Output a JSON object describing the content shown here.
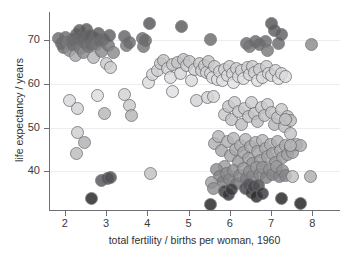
{
  "chart_data": {
    "type": "scatter",
    "title": "",
    "xlabel": "total fertility / births per woman, 1960",
    "ylabel": "life expectancy / years",
    "xlim": [
      1.62,
      8.67
    ],
    "ylim": [
      31.2,
      76.3
    ],
    "xticks": [
      2,
      3,
      4,
      5,
      6,
      7,
      8
    ],
    "yticks": [
      40,
      50,
      60,
      70
    ],
    "xtick_labels": [
      "2",
      "3",
      "4",
      "5",
      "6",
      "7",
      "8"
    ],
    "ytick_labels": [
      "40",
      "50",
      "60",
      "70"
    ],
    "grid": "horizontal",
    "legend": "none",
    "marker": {
      "shape": "circle",
      "size_px": 13,
      "opacity": 0.82,
      "edge_color": "#6f6f72"
    },
    "shade_levels": {
      "dark": "#6b6b6e",
      "near_black": "#202022",
      "mid": "#9a9a9d",
      "light": "#c9c9cc",
      "very_light": "#e4e4e7"
    },
    "points": [
      {
        "x": 1.85,
        "y": 70.2,
        "c": "#6b6b6e"
      },
      {
        "x": 1.92,
        "y": 69.1,
        "c": "#6b6b6e"
      },
      {
        "x": 1.98,
        "y": 68.2,
        "c": "#6b6b6e"
      },
      {
        "x": 2.02,
        "y": 70.4,
        "c": "#6b6b6e"
      },
      {
        "x": 2.06,
        "y": 69.4,
        "c": "#7a7a7d"
      },
      {
        "x": 2.12,
        "y": 67.6,
        "c": "#8a8a8d"
      },
      {
        "x": 2.18,
        "y": 70.1,
        "c": "#6b6b6e"
      },
      {
        "x": 2.22,
        "y": 68.6,
        "c": "#6b6b6e"
      },
      {
        "x": 2.25,
        "y": 66.3,
        "c": "#a8a8ab"
      },
      {
        "x": 2.28,
        "y": 71.2,
        "c": "#606063"
      },
      {
        "x": 2.32,
        "y": 69.8,
        "c": "#6b6b6e"
      },
      {
        "x": 2.35,
        "y": 72.0,
        "c": "#5c5c5f"
      },
      {
        "x": 2.38,
        "y": 68.0,
        "c": "#7a7a7d"
      },
      {
        "x": 2.42,
        "y": 70.6,
        "c": "#646467"
      },
      {
        "x": 2.45,
        "y": 67.2,
        "c": "#8a8a8d"
      },
      {
        "x": 2.48,
        "y": 69.3,
        "c": "#6b6b6e"
      },
      {
        "x": 2.52,
        "y": 72.4,
        "c": "#5a5a5d"
      },
      {
        "x": 2.55,
        "y": 70.8,
        "c": "#646467"
      },
      {
        "x": 2.58,
        "y": 68.4,
        "c": "#767679"
      },
      {
        "x": 2.62,
        "y": 71.0,
        "c": "#606063"
      },
      {
        "x": 2.66,
        "y": 69.0,
        "c": "#6b6b6e"
      },
      {
        "x": 2.7,
        "y": 66.0,
        "c": "#b8b8bb"
      },
      {
        "x": 2.74,
        "y": 70.3,
        "c": "#6b6b6e"
      },
      {
        "x": 2.78,
        "y": 68.8,
        "c": "#767679"
      },
      {
        "x": 2.82,
        "y": 71.4,
        "c": "#5c5c5f"
      },
      {
        "x": 2.86,
        "y": 69.6,
        "c": "#6b6b6e"
      },
      {
        "x": 2.9,
        "y": 67.4,
        "c": "#8a8a8d"
      },
      {
        "x": 2.95,
        "y": 70.0,
        "c": "#6b6b6e"
      },
      {
        "x": 3.0,
        "y": 64.5,
        "c": "#c9c9cc"
      },
      {
        "x": 3.05,
        "y": 68.7,
        "c": "#767679"
      },
      {
        "x": 3.08,
        "y": 70.9,
        "c": "#606063"
      },
      {
        "x": 3.12,
        "y": 63.6,
        "c": "#cfcfd2"
      },
      {
        "x": 3.18,
        "y": 67.0,
        "c": "#8a8a8d"
      },
      {
        "x": 3.45,
        "y": 70.8,
        "c": "#646467"
      },
      {
        "x": 3.5,
        "y": 68.6,
        "c": "#7a7a7d"
      },
      {
        "x": 3.56,
        "y": 69.4,
        "c": "#6b6b6e"
      },
      {
        "x": 3.88,
        "y": 70.3,
        "c": "#6b6b6e"
      },
      {
        "x": 3.92,
        "y": 68.5,
        "c": "#767679"
      },
      {
        "x": 3.96,
        "y": 69.8,
        "c": "#6b6b6e"
      },
      {
        "x": 4.06,
        "y": 73.8,
        "c": "#55555a"
      },
      {
        "x": 4.82,
        "y": 73.0,
        "c": "#5a5a5d"
      },
      {
        "x": 5.52,
        "y": 70.1,
        "c": "#6b6b6e"
      },
      {
        "x": 6.4,
        "y": 69.2,
        "c": "#6b6b6e"
      },
      {
        "x": 6.48,
        "y": 68.4,
        "c": "#767679"
      },
      {
        "x": 6.62,
        "y": 69.7,
        "c": "#6b6b6e"
      },
      {
        "x": 6.72,
        "y": 68.9,
        "c": "#6b6b6e"
      },
      {
        "x": 6.86,
        "y": 69.5,
        "c": "#6b6b6e"
      },
      {
        "x": 6.92,
        "y": 67.6,
        "c": "#7a7a7d"
      },
      {
        "x": 7.02,
        "y": 73.6,
        "c": "#55555a"
      },
      {
        "x": 7.08,
        "y": 72.0,
        "c": "#5c5c5f"
      },
      {
        "x": 7.18,
        "y": 69.2,
        "c": "#6b6b6e"
      },
      {
        "x": 7.24,
        "y": 71.2,
        "c": "#606063"
      },
      {
        "x": 7.98,
        "y": 68.8,
        "c": "#8a8a8d"
      },
      {
        "x": 2.12,
        "y": 56.2,
        "c": "#d8d8db"
      },
      {
        "x": 2.3,
        "y": 54.3,
        "c": "#d2d2d5"
      },
      {
        "x": 2.32,
        "y": 48.9,
        "c": "#cfcfd2"
      },
      {
        "x": 2.28,
        "y": 44.0,
        "c": "#bcbcbf"
      },
      {
        "x": 2.48,
        "y": 46.6,
        "c": "#b0b0b3"
      },
      {
        "x": 2.64,
        "y": 33.8,
        "c": "#242426"
      },
      {
        "x": 2.8,
        "y": 57.4,
        "c": "#dcdcdf"
      },
      {
        "x": 2.96,
        "y": 53.2,
        "c": "#b8b8bb"
      },
      {
        "x": 2.9,
        "y": 38.0,
        "c": "#56565a"
      },
      {
        "x": 3.04,
        "y": 38.5,
        "c": "#56565a"
      },
      {
        "x": 3.12,
        "y": 38.7,
        "c": "#4e4e52"
      },
      {
        "x": 3.44,
        "y": 57.6,
        "c": "#d2d2d5"
      },
      {
        "x": 3.58,
        "y": 55.0,
        "c": "#c9c9cc"
      },
      {
        "x": 3.62,
        "y": 52.8,
        "c": "#b6b6b9"
      },
      {
        "x": 4.08,
        "y": 39.5,
        "c": "#c2c2c5"
      },
      {
        "x": 4.02,
        "y": 60.2,
        "c": "#dcdcdf"
      },
      {
        "x": 4.12,
        "y": 62.0,
        "c": "#d6d6d9"
      },
      {
        "x": 4.24,
        "y": 63.0,
        "c": "#cfcfd2"
      },
      {
        "x": 4.32,
        "y": 64.6,
        "c": "#c9c9cc"
      },
      {
        "x": 4.4,
        "y": 65.3,
        "c": "#c4c4c7"
      },
      {
        "x": 4.48,
        "y": 63.4,
        "c": "#cfcfd2"
      },
      {
        "x": 4.56,
        "y": 61.5,
        "c": "#dcdcdf"
      },
      {
        "x": 4.6,
        "y": 64.4,
        "c": "#c9c9cc"
      },
      {
        "x": 4.62,
        "y": 58.2,
        "c": "#e0e0e3"
      },
      {
        "x": 4.72,
        "y": 64.9,
        "c": "#c4c4c7"
      },
      {
        "x": 4.8,
        "y": 62.4,
        "c": "#d6d6d9"
      },
      {
        "x": 4.88,
        "y": 65.6,
        "c": "#c2c2c5"
      },
      {
        "x": 4.96,
        "y": 64.2,
        "c": "#cccccf"
      },
      {
        "x": 5.02,
        "y": 65.0,
        "c": "#c4c4c7"
      },
      {
        "x": 5.08,
        "y": 60.8,
        "c": "#dadade"
      },
      {
        "x": 5.14,
        "y": 63.2,
        "c": "#cfcfd2"
      },
      {
        "x": 5.2,
        "y": 56.2,
        "c": "#d2d2d5"
      },
      {
        "x": 5.26,
        "y": 64.6,
        "c": "#c9c9cc"
      },
      {
        "x": 5.32,
        "y": 63.0,
        "c": "#cfcfd2"
      },
      {
        "x": 5.38,
        "y": 64.2,
        "c": "#c9c9cc"
      },
      {
        "x": 5.44,
        "y": 62.6,
        "c": "#d4d4d7"
      },
      {
        "x": 5.48,
        "y": 65.0,
        "c": "#c4c4c7"
      },
      {
        "x": 5.52,
        "y": 62.2,
        "c": "#d8d8db"
      },
      {
        "x": 5.46,
        "y": 56.8,
        "c": "#d2d2d5"
      },
      {
        "x": 5.58,
        "y": 61.4,
        "c": "#dcdcdf"
      },
      {
        "x": 5.64,
        "y": 63.8,
        "c": "#cccccf"
      },
      {
        "x": 5.7,
        "y": 61.0,
        "c": "#e0e0e3"
      },
      {
        "x": 5.76,
        "y": 62.8,
        "c": "#d4d4d7"
      },
      {
        "x": 5.82,
        "y": 60.6,
        "c": "#e0e0e3"
      },
      {
        "x": 5.88,
        "y": 63.2,
        "c": "#cfcfd2"
      },
      {
        "x": 5.94,
        "y": 61.8,
        "c": "#dadade"
      },
      {
        "x": 6.0,
        "y": 64.0,
        "c": "#cccccf"
      },
      {
        "x": 6.06,
        "y": 62.4,
        "c": "#d6d6d9"
      },
      {
        "x": 6.1,
        "y": 60.2,
        "c": "#e2e2e5"
      },
      {
        "x": 6.16,
        "y": 63.4,
        "c": "#cfcfd2"
      },
      {
        "x": 6.22,
        "y": 61.6,
        "c": "#dcdcdf"
      },
      {
        "x": 6.28,
        "y": 63.0,
        "c": "#d2d2d5"
      },
      {
        "x": 6.34,
        "y": 61.2,
        "c": "#e0e0e3"
      },
      {
        "x": 6.42,
        "y": 63.6,
        "c": "#cccccf"
      },
      {
        "x": 6.48,
        "y": 62.0,
        "c": "#d8d8db"
      },
      {
        "x": 6.54,
        "y": 64.0,
        "c": "#cccccf"
      },
      {
        "x": 6.6,
        "y": 62.6,
        "c": "#d4d4d7"
      },
      {
        "x": 6.66,
        "y": 60.8,
        "c": "#e0e0e3"
      },
      {
        "x": 6.72,
        "y": 63.2,
        "c": "#cfcfd2"
      },
      {
        "x": 6.8,
        "y": 61.4,
        "c": "#dcdcdf"
      },
      {
        "x": 6.88,
        "y": 63.8,
        "c": "#cccccf"
      },
      {
        "x": 6.94,
        "y": 62.2,
        "c": "#d8d8db"
      },
      {
        "x": 7.02,
        "y": 61.8,
        "c": "#dadade"
      },
      {
        "x": 7.1,
        "y": 63.0,
        "c": "#d2d2d5"
      },
      {
        "x": 7.18,
        "y": 61.2,
        "c": "#e0e0e3"
      },
      {
        "x": 7.26,
        "y": 62.4,
        "c": "#d6d6d9"
      },
      {
        "x": 7.34,
        "y": 61.6,
        "c": "#dcdcdf"
      },
      {
        "x": 5.6,
        "y": 57.0,
        "c": "#d6d6d9"
      },
      {
        "x": 5.88,
        "y": 53.0,
        "c": "#c9c9cc"
      },
      {
        "x": 5.96,
        "y": 54.8,
        "c": "#c4c4c7"
      },
      {
        "x": 6.04,
        "y": 51.8,
        "c": "#c2c2c5"
      },
      {
        "x": 6.12,
        "y": 55.6,
        "c": "#cccccf"
      },
      {
        "x": 6.2,
        "y": 53.6,
        "c": "#c4c4c7"
      },
      {
        "x": 6.28,
        "y": 50.8,
        "c": "#bcbcbf"
      },
      {
        "x": 6.36,
        "y": 54.4,
        "c": "#c9c9cc"
      },
      {
        "x": 6.44,
        "y": 52.4,
        "c": "#c2c2c5"
      },
      {
        "x": 6.52,
        "y": 55.8,
        "c": "#cccccf"
      },
      {
        "x": 6.6,
        "y": 53.2,
        "c": "#c4c4c7"
      },
      {
        "x": 6.68,
        "y": 51.4,
        "c": "#bcbcbf"
      },
      {
        "x": 6.76,
        "y": 54.6,
        "c": "#c9c9cc"
      },
      {
        "x": 6.84,
        "y": 52.8,
        "c": "#c2c2c5"
      },
      {
        "x": 6.92,
        "y": 55.2,
        "c": "#cccccf"
      },
      {
        "x": 7.0,
        "y": 53.4,
        "c": "#c4c4c7"
      },
      {
        "x": 7.08,
        "y": 50.6,
        "c": "#b8b8bb"
      },
      {
        "x": 7.16,
        "y": 52.2,
        "c": "#c2c2c5"
      },
      {
        "x": 7.24,
        "y": 54.0,
        "c": "#c9c9cc"
      },
      {
        "x": 7.32,
        "y": 50.2,
        "c": "#bcbcbf"
      },
      {
        "x": 7.4,
        "y": 52.6,
        "c": "#c2c2c5"
      },
      {
        "x": 7.48,
        "y": 51.6,
        "c": "#bcbcbf"
      },
      {
        "x": 7.46,
        "y": 48.6,
        "c": "#c4c4c7"
      },
      {
        "x": 5.64,
        "y": 46.4,
        "c": "#b0b0b3"
      },
      {
        "x": 5.72,
        "y": 48.0,
        "c": "#b6b6b9"
      },
      {
        "x": 5.8,
        "y": 44.8,
        "c": "#a8a8ab"
      },
      {
        "x": 5.86,
        "y": 41.2,
        "c": "#9a9a9d"
      },
      {
        "x": 5.94,
        "y": 46.8,
        "c": "#b0b0b3"
      },
      {
        "x": 6.02,
        "y": 43.6,
        "c": "#a4a4a7"
      },
      {
        "x": 6.08,
        "y": 47.6,
        "c": "#b6b6b9"
      },
      {
        "x": 6.14,
        "y": 45.0,
        "c": "#a8a8ab"
      },
      {
        "x": 6.2,
        "y": 42.2,
        "c": "#9a9a9d"
      },
      {
        "x": 6.26,
        "y": 46.0,
        "c": "#b0b0b3"
      },
      {
        "x": 6.32,
        "y": 44.2,
        "c": "#a4a4a7"
      },
      {
        "x": 6.38,
        "y": 47.2,
        "c": "#b6b6b9"
      },
      {
        "x": 6.44,
        "y": 43.0,
        "c": "#a0a0a3"
      },
      {
        "x": 6.5,
        "y": 45.6,
        "c": "#a8a8ab"
      },
      {
        "x": 6.56,
        "y": 41.8,
        "c": "#9a9a9d"
      },
      {
        "x": 6.62,
        "y": 46.6,
        "c": "#b0b0b3"
      },
      {
        "x": 6.68,
        "y": 44.6,
        "c": "#a4a4a7"
      },
      {
        "x": 6.74,
        "y": 42.6,
        "c": "#9a9a9d"
      },
      {
        "x": 6.8,
        "y": 47.0,
        "c": "#b6b6b9"
      },
      {
        "x": 6.86,
        "y": 45.2,
        "c": "#a8a8ab"
      },
      {
        "x": 6.92,
        "y": 43.4,
        "c": "#a0a0a3"
      },
      {
        "x": 6.98,
        "y": 46.2,
        "c": "#b0b0b3"
      },
      {
        "x": 7.04,
        "y": 44.0,
        "c": "#a4a4a7"
      },
      {
        "x": 7.1,
        "y": 42.0,
        "c": "#9a9a9d"
      },
      {
        "x": 7.16,
        "y": 46.8,
        "c": "#b0b0b3"
      },
      {
        "x": 7.22,
        "y": 44.8,
        "c": "#a8a8ab"
      },
      {
        "x": 7.28,
        "y": 43.2,
        "c": "#a0a0a3"
      },
      {
        "x": 7.34,
        "y": 45.8,
        "c": "#aeaeb1"
      },
      {
        "x": 7.4,
        "y": 43.8,
        "c": "#a4a4a7"
      },
      {
        "x": 7.46,
        "y": 45.4,
        "c": "#aaaaad"
      },
      {
        "x": 7.52,
        "y": 44.4,
        "c": "#a4a4a7"
      },
      {
        "x": 7.62,
        "y": 46.2,
        "c": "#b0b0b3"
      },
      {
        "x": 7.72,
        "y": 45.8,
        "c": "#aeaeb1"
      },
      {
        "x": 5.68,
        "y": 40.4,
        "c": "#8e8e91"
      },
      {
        "x": 5.76,
        "y": 38.8,
        "c": "#86868a"
      },
      {
        "x": 5.84,
        "y": 37.6,
        "c": "#7e7e82"
      },
      {
        "x": 5.92,
        "y": 39.6,
        "c": "#8a8a8d"
      },
      {
        "x": 6.0,
        "y": 38.2,
        "c": "#86868a"
      },
      {
        "x": 6.08,
        "y": 40.2,
        "c": "#8e8e91"
      },
      {
        "x": 6.16,
        "y": 37.2,
        "c": "#76767a"
      },
      {
        "x": 6.24,
        "y": 39.0,
        "c": "#86868a"
      },
      {
        "x": 6.32,
        "y": 40.6,
        "c": "#9a9a9d"
      },
      {
        "x": 6.4,
        "y": 38.4,
        "c": "#7e7e82"
      },
      {
        "x": 6.48,
        "y": 40.0,
        "c": "#8e8e91"
      },
      {
        "x": 6.56,
        "y": 38.8,
        "c": "#86868a"
      },
      {
        "x": 6.64,
        "y": 41.0,
        "c": "#9a9a9d"
      },
      {
        "x": 6.72,
        "y": 39.2,
        "c": "#86868a"
      },
      {
        "x": 6.8,
        "y": 40.8,
        "c": "#929295"
      },
      {
        "x": 6.88,
        "y": 38.6,
        "c": "#828286"
      },
      {
        "x": 6.96,
        "y": 40.4,
        "c": "#8e8e91"
      },
      {
        "x": 7.04,
        "y": 39.4,
        "c": "#86868a"
      },
      {
        "x": 7.12,
        "y": 41.2,
        "c": "#9a9a9d"
      },
      {
        "x": 7.2,
        "y": 38.8,
        "c": "#828286"
      },
      {
        "x": 7.28,
        "y": 40.2,
        "c": "#8e8e91"
      },
      {
        "x": 7.36,
        "y": 39.0,
        "c": "#86868a"
      },
      {
        "x": 5.56,
        "y": 37.4,
        "c": "#a0a0a3"
      },
      {
        "x": 5.6,
        "y": 36.2,
        "c": "#8e8e91"
      },
      {
        "x": 5.88,
        "y": 35.4,
        "c": "#3c3c40"
      },
      {
        "x": 5.96,
        "y": 34.8,
        "c": "#343438"
      },
      {
        "x": 6.04,
        "y": 35.8,
        "c": "#3c3c40"
      },
      {
        "x": 6.38,
        "y": 36.0,
        "c": "#46464a"
      },
      {
        "x": 6.44,
        "y": 37.0,
        "c": "#56565a"
      },
      {
        "x": 6.52,
        "y": 35.2,
        "c": "#3c3c40"
      },
      {
        "x": 6.58,
        "y": 36.6,
        "c": "#4a4a4e"
      },
      {
        "x": 6.64,
        "y": 34.2,
        "c": "#2c2c30"
      },
      {
        "x": 6.7,
        "y": 36.8,
        "c": "#4e4e52"
      },
      {
        "x": 6.78,
        "y": 35.0,
        "c": "#38383c"
      },
      {
        "x": 5.52,
        "y": 32.4,
        "c": "#242426"
      },
      {
        "x": 7.26,
        "y": 33.8,
        "c": "#242426"
      },
      {
        "x": 7.7,
        "y": 32.6,
        "c": "#202022"
      },
      {
        "x": 7.52,
        "y": 38.8,
        "c": "#c2c2c5"
      },
      {
        "x": 7.96,
        "y": 38.8,
        "c": "#aeaeb1"
      },
      {
        "x": 7.34,
        "y": 51.8,
        "c": "#c2c2c5"
      },
      {
        "x": 7.48,
        "y": 46.0,
        "c": "#b6b6b9"
      }
    ]
  }
}
